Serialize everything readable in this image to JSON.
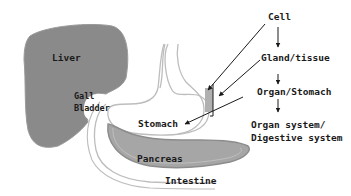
{
  "organs": {
    "liver": "Liver",
    "gall_bladder_line1": "Gall",
    "gall_bladder_line2": "Bladder",
    "stomach": "Stomach",
    "pancreas": "Pancreas",
    "intestine": "Intestine"
  },
  "hierarchy": {
    "level1": "Cell",
    "level2": "Gland/tissue",
    "level3": "Organ/Stomach",
    "level4_line1": "Organ system/",
    "level4_line2": "Digestive system"
  },
  "colors": {
    "liver": "#8a8a8a",
    "pancreas": "#a6a6a6",
    "outline": "#bdbdbd",
    "text": "#1a1a1a",
    "tissue_patch": "#b0b0b0"
  }
}
